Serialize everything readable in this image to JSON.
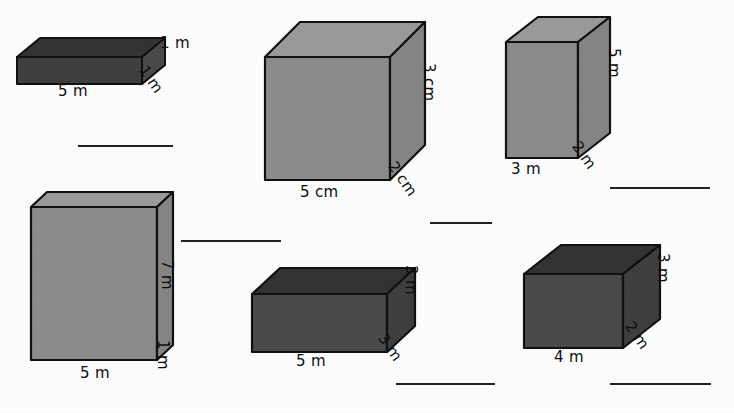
{
  "worksheet": {
    "background_color": "#fdfdfd",
    "line_color": "#222222",
    "dark_fill": "#3f3f3f",
    "dark_top_fill": "#333333",
    "dark_side_fill": "#4a4a4a",
    "light_fill": "#8c8c8c",
    "light_top_fill": "#9a9a9a",
    "light_side_fill": "#858585",
    "stroke_color": "#111111"
  },
  "shapes": [
    {
      "id": "cuboid-1",
      "shade": "dark",
      "labels": {
        "width": "5 m",
        "height": "1 m",
        "depth": "1 m"
      }
    },
    {
      "id": "cuboid-2",
      "shade": "light",
      "labels": {
        "width": "5 cm",
        "height": "3 cm",
        "depth": "2 cm"
      }
    },
    {
      "id": "cuboid-3",
      "shade": "light",
      "labels": {
        "width": "3 m",
        "height": "5 m",
        "depth": "2 m"
      }
    },
    {
      "id": "cuboid-4",
      "shade": "light",
      "labels": {
        "width": "5 m",
        "height": "7 m",
        "depth": "1 m"
      }
    },
    {
      "id": "cuboid-5",
      "shade": "dark",
      "labels": {
        "width": "5 m",
        "height": "3 m",
        "depth": "3 m"
      }
    },
    {
      "id": "cuboid-6",
      "shade": "dark",
      "labels": {
        "width": "4 m",
        "height": "3 m",
        "depth": "2 m"
      }
    }
  ],
  "answer_lines": [
    {
      "id": "answer-line-1"
    },
    {
      "id": "answer-line-2"
    },
    {
      "id": "answer-line-3"
    },
    {
      "id": "answer-line-4"
    },
    {
      "id": "answer-line-5"
    },
    {
      "id": "answer-line-6"
    }
  ]
}
